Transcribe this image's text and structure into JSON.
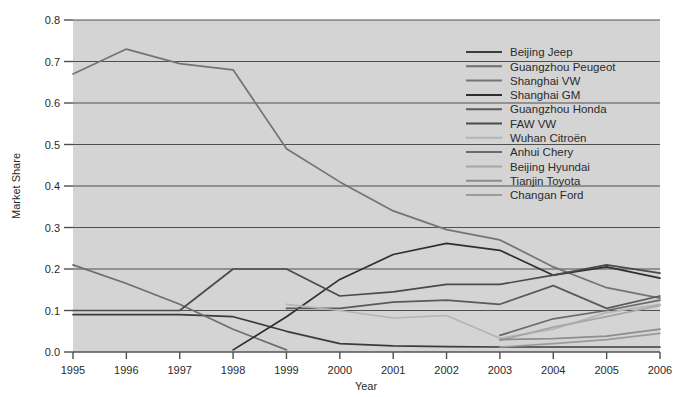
{
  "chart_data": {
    "type": "line",
    "title": "",
    "xlabel": "Year",
    "ylabel": "Market Share",
    "categories": [
      1995,
      1996,
      1997,
      1998,
      1999,
      2000,
      2001,
      2002,
      2003,
      2004,
      2005,
      2006
    ],
    "x": [
      1995,
      1996,
      1997,
      1998,
      1999,
      2000,
      2001,
      2002,
      2003,
      2004,
      2005,
      2006
    ],
    "xlim": [
      1995,
      2006
    ],
    "ylim": [
      0.0,
      0.8
    ],
    "yticks": [
      "0.0",
      "0.1",
      "0.2",
      "0.3",
      "0.4",
      "0.5",
      "0.6",
      "0.7",
      "0.8"
    ],
    "xticks": [
      "1995",
      "1996",
      "1997",
      "1998",
      "1999",
      "2000",
      "2001",
      "2002",
      "2003",
      "2004",
      "2005",
      "2006"
    ],
    "grid": "horizontal",
    "legend_position": "upper-right-inside",
    "plot_background": "#d4d4d4",
    "series": [
      {
        "name": "Beijing Jeep",
        "color": "#3b3b3b",
        "values": [
          0.09,
          0.09,
          0.09,
          0.085,
          0.05,
          0.02,
          0.015,
          0.013,
          0.012,
          0.012,
          0.012,
          0.012
        ]
      },
      {
        "name": "Guangzhou Peugeot",
        "color": "#6e6e6e",
        "values": [
          0.21,
          0.165,
          0.115,
          0.055,
          0.005,
          null,
          null,
          null,
          null,
          null,
          null,
          null
        ]
      },
      {
        "name": "Shanghai VW",
        "color": "#747474",
        "values": [
          0.67,
          0.73,
          0.695,
          0.68,
          0.49,
          0.41,
          0.34,
          0.295,
          0.27,
          0.205,
          0.155,
          0.13
        ]
      },
      {
        "name": "Shanghai GM",
        "color": "#2f2f2f",
        "values": [
          null,
          null,
          null,
          0.005,
          0.085,
          0.175,
          0.235,
          0.262,
          0.245,
          0.185,
          0.205,
          0.178
        ]
      },
      {
        "name": "Guangzhou Honda",
        "color": "#5a5a5a",
        "values": [
          null,
          null,
          null,
          null,
          0.105,
          0.105,
          0.12,
          0.125,
          0.115,
          0.16,
          0.105,
          0.135
        ]
      },
      {
        "name": "FAW VW",
        "color": "#4a4a4a",
        "values": [
          0.1,
          0.1,
          0.1,
          0.2,
          0.2,
          0.135,
          0.145,
          0.163,
          0.163,
          0.185,
          0.21,
          0.19
        ]
      },
      {
        "name": "Wuhan Citroën",
        "color": "#b4b4b4",
        "values": [
          null,
          null,
          null,
          null,
          0.115,
          0.1,
          0.082,
          0.088,
          0.033,
          0.055,
          0.095,
          0.115
        ]
      },
      {
        "name": "Anhui Chery",
        "color": "#6a6a6a",
        "values": [
          null,
          null,
          null,
          null,
          null,
          null,
          null,
          null,
          0.04,
          0.08,
          0.1,
          0.125
        ]
      },
      {
        "name": "Beijing Hyundai",
        "color": "#a6a6a6",
        "values": [
          null,
          null,
          null,
          null,
          null,
          null,
          null,
          null,
          0.028,
          0.06,
          0.085,
          0.112
        ]
      },
      {
        "name": "Tianjin Toyota",
        "color": "#8d8d8d",
        "values": [
          null,
          null,
          null,
          null,
          null,
          null,
          null,
          null,
          0.03,
          0.032,
          0.038,
          0.055
        ]
      },
      {
        "name": "Changan Ford",
        "color": "#9a9a9a",
        "values": [
          null,
          null,
          null,
          null,
          null,
          null,
          null,
          null,
          0.012,
          0.02,
          0.03,
          0.045
        ]
      }
    ]
  },
  "axes": {
    "ylabel": "Market Share",
    "xlabel": "Year"
  }
}
